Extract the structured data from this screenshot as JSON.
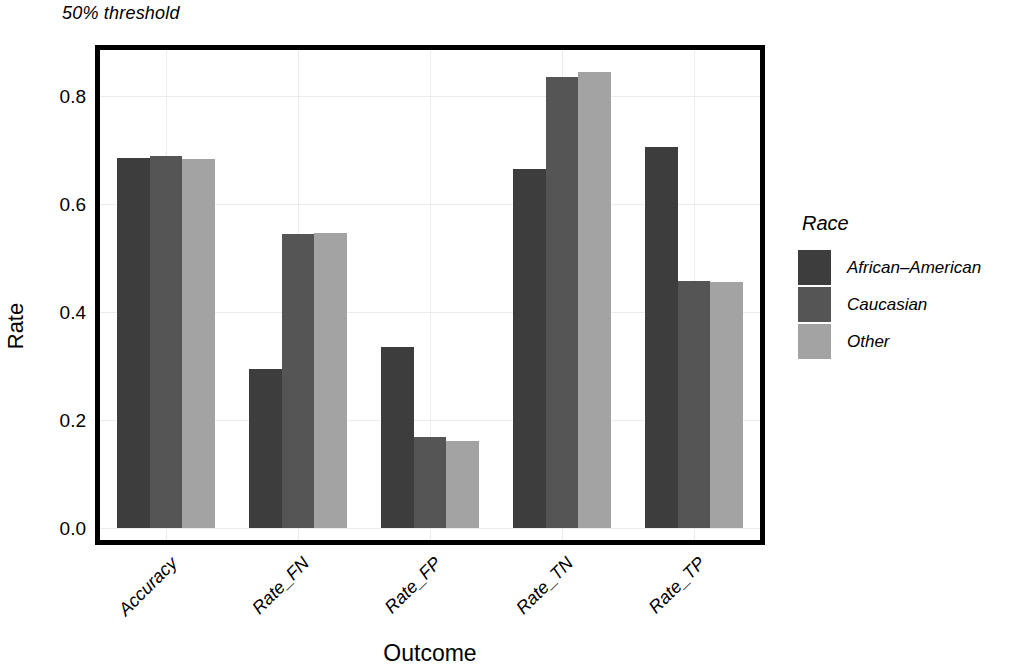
{
  "chart_data": {
    "type": "bar",
    "title": "50% threshold",
    "xlabel": "Outcome",
    "ylabel": "Rate",
    "categories": [
      "Accuracy",
      "Rate_FN",
      "Rate_FP",
      "Rate_TN",
      "Rate_TP"
    ],
    "series": [
      {
        "name": "African-American",
        "color": "#3d3d3d",
        "values": [
          0.685,
          0.295,
          0.335,
          0.665,
          0.705
        ]
      },
      {
        "name": "Caucasian",
        "color": "#555555",
        "values": [
          0.688,
          0.545,
          0.168,
          0.835,
          0.458
        ]
      },
      {
        "name": "Other",
        "color": "#a3a3a3",
        "values": [
          0.683,
          0.547,
          0.162,
          0.845,
          0.455
        ]
      }
    ],
    "ylim": [
      0.0,
      0.88
    ],
    "yticks": [
      0.0,
      0.2,
      0.4,
      0.6,
      0.8
    ],
    "ytick_labels": [
      "0.0",
      "0.2",
      "0.4",
      "0.6",
      "0.8"
    ],
    "grid": true,
    "legend_position": "right",
    "legend_title": "Race"
  },
  "legend": {
    "title": "Race",
    "entries": [
      {
        "label": "African–American",
        "color": "#3d3d3d"
      },
      {
        "label": "Caucasian",
        "color": "#555555"
      },
      {
        "label": "Other",
        "color": "#a3a3a3"
      }
    ]
  },
  "axes": {
    "y_title": "Rate",
    "x_title": "Outcome",
    "y_tick_labels": [
      "0.0",
      "0.2",
      "0.4",
      "0.6",
      "0.8"
    ],
    "x_tick_labels": [
      "Accuracy",
      "Rate_FN",
      "Rate_FP",
      "Rate_TN",
      "Rate_TP"
    ]
  },
  "header": {
    "title": "50% threshold"
  },
  "colors": {
    "frame": "#000000",
    "grid": "#ebebeb",
    "background": "#ffffff"
  }
}
